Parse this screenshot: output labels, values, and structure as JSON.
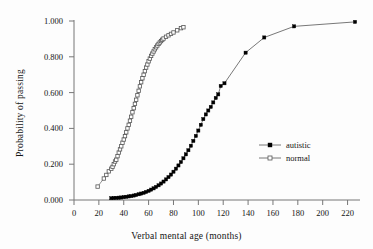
{
  "chart_data": {
    "type": "line",
    "title": "",
    "subtitle": "",
    "xlabel": "Verbal mental age (months)",
    "ylabel": "Probability of passing",
    "xlim": [
      0,
      230
    ],
    "ylim": [
      0.0,
      1.0
    ],
    "grid": false,
    "legend_position": "center-right",
    "xticks": [
      0,
      20,
      40,
      60,
      80,
      100,
      120,
      140,
      160,
      180,
      200,
      220
    ],
    "xtick_labels": [
      "0",
      "20",
      "40",
      "60",
      "80",
      "100",
      "120",
      "140",
      "160",
      "180",
      "200",
      "220"
    ],
    "yticks": [
      0.0,
      0.2,
      0.4,
      0.6,
      0.8,
      1.0
    ],
    "ytick_labels": [
      "0.000",
      "0.200",
      "0.400",
      "0.600",
      "0.800",
      "1.000"
    ],
    "series": [
      {
        "name": "autistic",
        "marker": "filled-square",
        "color": "#000000",
        "line_color": "#555555",
        "x": [
          30,
          32,
          34,
          36,
          38,
          40,
          42,
          44,
          46,
          48,
          50,
          52,
          54,
          56,
          58,
          60,
          62,
          64,
          66,
          68,
          70,
          72,
          74,
          76,
          78,
          80,
          82,
          84,
          86,
          88,
          90,
          92,
          94,
          96,
          98,
          100,
          102,
          104,
          106,
          108,
          110,
          112,
          114,
          116,
          118,
          121,
          138,
          153,
          177,
          226
        ],
        "y": [
          0.01,
          0.011,
          0.012,
          0.013,
          0.014,
          0.016,
          0.018,
          0.02,
          0.022,
          0.025,
          0.028,
          0.032,
          0.036,
          0.04,
          0.045,
          0.051,
          0.058,
          0.065,
          0.073,
          0.082,
          0.092,
          0.103,
          0.115,
          0.128,
          0.142,
          0.158,
          0.175,
          0.193,
          0.212,
          0.233,
          0.255,
          0.278,
          0.303,
          0.33,
          0.358,
          0.388,
          0.42,
          0.452,
          0.478,
          0.5,
          0.52,
          0.545,
          0.57,
          0.59,
          0.637,
          0.652,
          0.823,
          0.908,
          0.97,
          0.995
        ]
      },
      {
        "name": "normal",
        "marker": "open-square",
        "color": "#ffffff",
        "line_color": "#777777",
        "x": [
          19,
          24,
          26,
          28,
          30,
          31,
          32,
          33,
          34,
          35,
          36,
          37,
          38,
          39,
          40,
          41,
          42,
          43,
          44,
          45,
          46,
          47,
          48,
          49,
          50,
          51,
          52,
          53,
          54,
          55,
          56,
          57,
          58,
          59,
          60,
          61,
          62,
          63,
          64,
          65,
          66,
          67,
          68,
          69,
          70,
          71,
          72,
          74,
          76,
          78,
          80,
          83,
          86,
          88
        ],
        "y": [
          0.075,
          0.12,
          0.14,
          0.16,
          0.175,
          0.185,
          0.2,
          0.215,
          0.225,
          0.245,
          0.265,
          0.283,
          0.3,
          0.32,
          0.338,
          0.357,
          0.378,
          0.4,
          0.42,
          0.443,
          0.465,
          0.49,
          0.513,
          0.537,
          0.56,
          0.585,
          0.61,
          0.635,
          0.658,
          0.68,
          0.7,
          0.72,
          0.74,
          0.757,
          0.775,
          0.79,
          0.805,
          0.818,
          0.83,
          0.842,
          0.853,
          0.863,
          0.872,
          0.88,
          0.888,
          0.895,
          0.902,
          0.912,
          0.92,
          0.928,
          0.936,
          0.948,
          0.96,
          0.965
        ]
      }
    ]
  },
  "legend": {
    "entries": [
      {
        "label": "autistic",
        "marker": "filled-square"
      },
      {
        "label": "normal",
        "marker": "open-square"
      }
    ]
  }
}
